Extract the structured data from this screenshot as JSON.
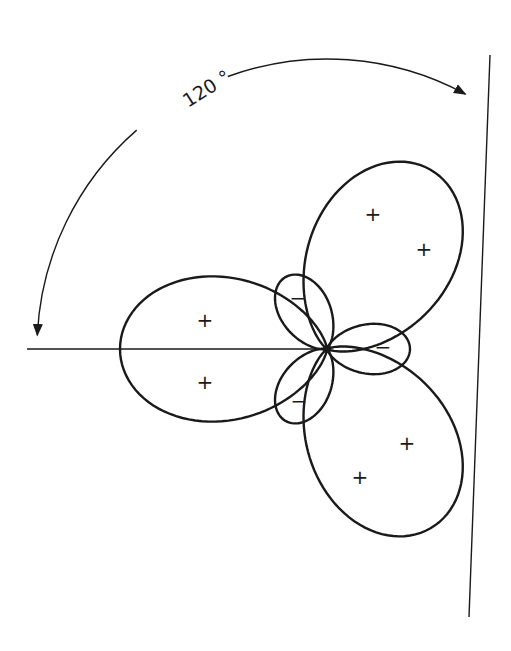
{
  "diagram": {
    "type": "polar-lobe-pattern",
    "center": [
      327,
      349
    ],
    "angle_annotation": {
      "label": "120 °",
      "arc_from_deg": 180,
      "arc_to_deg": 60,
      "radius": 290
    },
    "axes": [
      {
        "name": "horizontal-axis",
        "from": [
          27,
          349
        ],
        "to": [
          327,
          349
        ]
      },
      {
        "name": "diagonal-axis",
        "from": [
          490,
          55
        ],
        "to": [
          469,
          617
        ]
      }
    ],
    "lobes": [
      {
        "name": "positive-lobe-left",
        "sign": "+",
        "angle_deg": 180,
        "length": 207,
        "exponent": 2.5
      },
      {
        "name": "positive-lobe-upper-right",
        "sign": "+",
        "angle_deg": 60,
        "length": 207,
        "exponent": 2.5
      },
      {
        "name": "positive-lobe-lower-right",
        "sign": "+",
        "angle_deg": -60,
        "length": 207,
        "exponent": 2.5
      },
      {
        "name": "negative-lobe-right",
        "sign": "−",
        "angle_deg": 0,
        "length": 83,
        "exponent": 3.5
      },
      {
        "name": "negative-lobe-upper-left",
        "sign": "−",
        "angle_deg": 120,
        "length": 83,
        "exponent": 3.5
      },
      {
        "name": "negative-lobe-lower-left",
        "sign": "−",
        "angle_deg": -120,
        "length": 83,
        "exponent": 3.5
      }
    ],
    "signs": [
      {
        "text": "+",
        "x": 205,
        "y": 320
      },
      {
        "text": "+",
        "x": 205,
        "y": 382
      },
      {
        "text": "+",
        "x": 373,
        "y": 214
      },
      {
        "text": "+",
        "x": 424,
        "y": 249
      },
      {
        "text": "+",
        "x": 407,
        "y": 443
      },
      {
        "text": "+",
        "x": 360,
        "y": 477
      },
      {
        "text": "−",
        "x": 298,
        "y": 298
      },
      {
        "text": "−",
        "x": 383,
        "y": 347
      },
      {
        "text": "−",
        "x": 299,
        "y": 401
      }
    ]
  }
}
